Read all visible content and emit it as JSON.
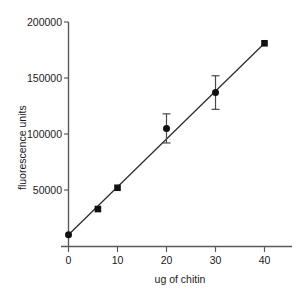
{
  "chart_data": {
    "type": "scatter",
    "title": "",
    "xlabel": "ug of chitin",
    "ylabel": "fluorescence units",
    "xlim": [
      0,
      45
    ],
    "ylim": [
      0,
      200000
    ],
    "xticks": [
      0,
      10,
      20,
      30,
      40
    ],
    "xtick_labels": [
      "0",
      "10",
      "20",
      "30",
      "40"
    ],
    "yticks": [
      0,
      50000,
      100000,
      150000,
      200000
    ],
    "ytick_labels": [
      "0",
      "50000",
      "100000",
      "150000",
      "200000"
    ],
    "grid": false,
    "legend": "none",
    "marker_color": "#111111",
    "line_color": "#2b2b2b",
    "x": [
      0,
      6,
      10,
      20,
      30,
      40
    ],
    "y": [
      10000,
      33000,
      52000,
      105000,
      137000,
      181000
    ],
    "yerr": [
      0,
      0,
      0,
      13000,
      15000,
      0
    ],
    "markers": [
      "circle",
      "square",
      "square",
      "circle",
      "circle",
      "square"
    ],
    "series": [
      {
        "name": "chitin standard curve",
        "points": [
          {
            "x": 0,
            "y": 10000,
            "err": 0,
            "marker": "circle"
          },
          {
            "x": 6,
            "y": 33000,
            "err": 0,
            "marker": "square"
          },
          {
            "x": 10,
            "y": 52000,
            "err": 0,
            "marker": "square"
          },
          {
            "x": 20,
            "y": 105000,
            "err": 13000,
            "marker": "circle"
          },
          {
            "x": 30,
            "y": 137000,
            "err": 15000,
            "marker": "circle"
          },
          {
            "x": 40,
            "y": 181000,
            "err": 0,
            "marker": "square"
          }
        ]
      }
    ],
    "fit_line": {
      "x0": 0,
      "y0": 10000,
      "x1": 40,
      "y1": 181000
    }
  }
}
